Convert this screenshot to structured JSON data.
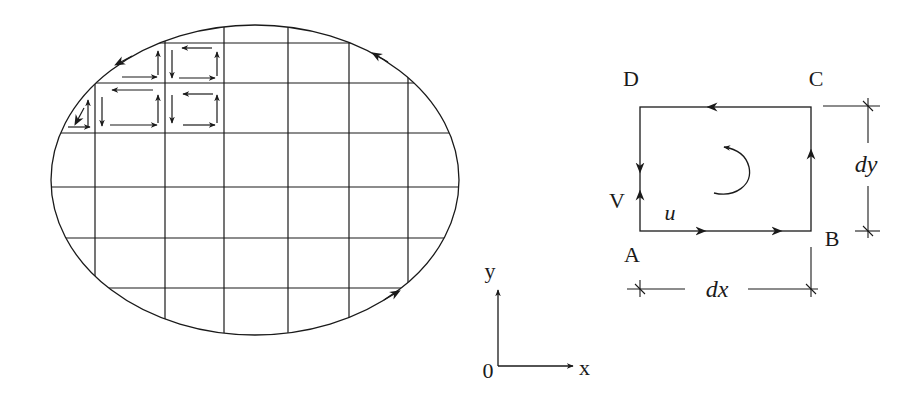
{
  "figure": {
    "colors": {
      "stroke": "#1a1a1a",
      "background": "#ffffff"
    }
  },
  "region": {
    "shape": "ellipse",
    "grid": "rectangular mesh of elemental cells",
    "boundary_direction": "counter-clockwise"
  },
  "axes": {
    "origin_label": "0",
    "x_label": "x",
    "y_label": "y"
  },
  "element": {
    "corners": {
      "a": "A",
      "b": "B",
      "c": "C",
      "d": "D"
    },
    "velocity_labels": {
      "horizontal": "u",
      "vertical": "V"
    },
    "dimensions": {
      "width": "dx",
      "height": "dy"
    },
    "rotation": "counter-clockwise"
  }
}
